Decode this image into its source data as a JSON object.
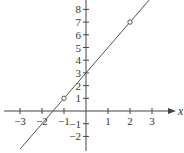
{
  "chart_data": {
    "type": "line",
    "title": "",
    "xlabel": "x",
    "ylabel": "",
    "xlim": [
      -3.7,
      3.9
    ],
    "ylim": [
      -3.1,
      8.7
    ],
    "grid": false,
    "x_ticks": [
      -3,
      -2,
      -1,
      1,
      2,
      3
    ],
    "y_ticks": [
      -2,
      -1,
      1,
      2,
      3,
      4,
      5,
      6,
      7,
      8
    ],
    "series": [
      {
        "name": "y = 2x + 3",
        "slope": 2,
        "intercept": 3,
        "x": [
          -3,
          2.9
        ],
        "y": [
          -3,
          8.8
        ]
      }
    ],
    "marked_points": [
      {
        "x": -1,
        "y": 1
      },
      {
        "x": 2,
        "y": 7
      }
    ],
    "colors": {
      "axis": "#444444",
      "line": "#555555",
      "text": "#333333"
    }
  }
}
